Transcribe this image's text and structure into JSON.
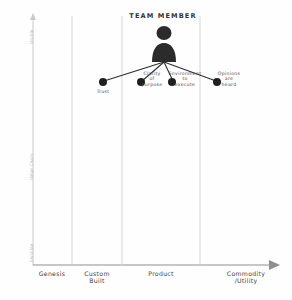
{
  "diagram": {
    "type": "wardley-map",
    "title": "TEAM MEMBER",
    "anchor_icon": "person-silhouette-icon",
    "background": "#fefefe",
    "ink_color": "#3a3a3a",
    "axis_color": "#c9c9c9"
  },
  "y_axis": {
    "top_label": "Visible",
    "middle_label": "Value Chain",
    "bottom_label": "Invisible",
    "arrow": "up-arrow-icon"
  },
  "x_axis": {
    "arrow": "right-arrow-icon",
    "stages": [
      {
        "label": "Genesis",
        "x": 52
      },
      {
        "label": "Custom\nBuilt",
        "x": 97
      },
      {
        "label": "Product",
        "x": 161
      },
      {
        "label": "Commodity\n/Utility",
        "x": 246
      }
    ],
    "gridlines": [
      72,
      122,
      200
    ]
  },
  "anchor": {
    "label": "TEAM MEMBER",
    "label_x": 163,
    "label_y": 17,
    "icon_x": 164,
    "icon_y": 47
  },
  "nodes": [
    {
      "name": "trust",
      "label": "Trust",
      "x": 103,
      "y": 82,
      "label_x": 103,
      "label_y": 90
    },
    {
      "name": "clarity-of-purpose",
      "label": "Clarity\nof\npurpose",
      "x": 141,
      "y": 82,
      "label_x": 152,
      "label_y": 74
    },
    {
      "name": "environment-to-execute",
      "label": "Environment\nto\nexecute",
      "x": 172,
      "y": 82,
      "label_x": 185,
      "label_y": 74
    },
    {
      "name": "opinions-are-heard",
      "label": "Opinions\nare\nheard",
      "x": 217,
      "y": 82,
      "label_x": 229,
      "label_y": 74
    }
  ],
  "links": [
    {
      "from": "anchor",
      "to": "trust"
    },
    {
      "from": "anchor",
      "to": "clarity-of-purpose"
    },
    {
      "from": "anchor",
      "to": "environment-to-execute"
    },
    {
      "from": "anchor",
      "to": "opinions-are-heard"
    }
  ]
}
